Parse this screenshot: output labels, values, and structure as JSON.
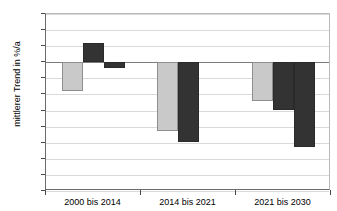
{
  "chart_data": {
    "type": "bar",
    "title": "",
    "xlabel": "",
    "ylabel": "mittlerer Trend in %/a",
    "ylim": [
      -4.0,
      1.5
    ],
    "ytick_labels": [
      "1.5",
      "1.0",
      "0.5",
      "0.0",
      "-0.5",
      "-1.0",
      "-1.5",
      "-2.0",
      "-2.5",
      "-3.0",
      "-3.5",
      "-4.0"
    ],
    "ytick_values": [
      1.5,
      1.0,
      0.5,
      0.0,
      -0.5,
      -1.0,
      -1.5,
      -2.0,
      -2.5,
      -3.0,
      -3.5,
      -4.0
    ],
    "grid": true,
    "legend": "none",
    "categories": [
      "2000 bis 2014",
      "2014 bis 2021",
      "2021 bis 2030"
    ],
    "series": [
      {
        "name": "series-1",
        "color": "#c9c9c9",
        "values": [
          -0.9,
          -2.15,
          -1.2
        ]
      },
      {
        "name": "series-2",
        "color": "#333333",
        "values": [
          0.6,
          -2.5,
          -1.5
        ]
      },
      {
        "name": "series-3",
        "color": "#333333",
        "values": [
          -0.2,
          null,
          -2.65
        ]
      }
    ]
  },
  "colors": {
    "light_bar": "#c9c9c9",
    "dark_bar": "#333333",
    "gridline": "#d9d9d9",
    "axis": "#6b6b6b",
    "background": "#ffffff"
  }
}
